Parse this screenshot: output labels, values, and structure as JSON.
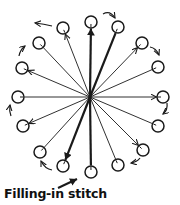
{
  "caption": "Filling-in stitch",
  "diagram": {
    "center": [
      90,
      97
    ],
    "stroke_color": "#1a1a1a",
    "circle_radius": 6,
    "spokes": [
      {
        "id": "top",
        "circle": [
          91,
          22
        ],
        "arrow": "to-circle",
        "weight": "bold"
      },
      {
        "id": "top-right-1",
        "circle": [
          118,
          27
        ],
        "arrow": "none",
        "weight": "bold"
      },
      {
        "id": "top-right-2",
        "circle": [
          142,
          43
        ],
        "arrow": "to-circle",
        "weight": "thin"
      },
      {
        "id": "right-upper",
        "circle": [
          158,
          67
        ],
        "arrow": "none",
        "weight": "thin"
      },
      {
        "id": "right",
        "circle": [
          163,
          97
        ],
        "arrow": "to-circle",
        "weight": "thin"
      },
      {
        "id": "right-lower",
        "circle": [
          158,
          126
        ],
        "arrow": "none",
        "weight": "thin"
      },
      {
        "id": "bottom-right-2",
        "circle": [
          143,
          150
        ],
        "arrow": "to-circle",
        "weight": "thin"
      },
      {
        "id": "bottom-right-1",
        "circle": [
          118,
          165
        ],
        "arrow": "none",
        "weight": "thin"
      },
      {
        "id": "bottom",
        "circle": [
          91,
          172
        ],
        "arrow": "none",
        "weight": "bold"
      },
      {
        "id": "bottom-left-1",
        "circle": [
          63,
          166
        ],
        "arrow": "to-circle",
        "weight": "bold"
      },
      {
        "id": "bottom-left-2",
        "circle": [
          40,
          152
        ],
        "arrow": "none",
        "weight": "thin"
      },
      {
        "id": "left-lower",
        "circle": [
          23,
          126
        ],
        "arrow": "to-circle",
        "weight": "thin"
      },
      {
        "id": "left",
        "circle": [
          18,
          97
        ],
        "arrow": "none",
        "weight": "thin"
      },
      {
        "id": "left-upper",
        "circle": [
          22,
          68
        ],
        "arrow": "to-circle",
        "weight": "thin"
      },
      {
        "id": "top-left-2",
        "circle": [
          39,
          43
        ],
        "arrow": "none",
        "weight": "thin"
      },
      {
        "id": "top-left-1",
        "circle": [
          63,
          28
        ],
        "arrow": "to-circle",
        "weight": "thin"
      }
    ],
    "outer_arrows": [
      {
        "from": [
          103,
          14
        ],
        "to": [
          115,
          18
        ],
        "curve": [
          110,
          10
        ]
      },
      {
        "from": [
          150,
          47
        ],
        "to": [
          159,
          55
        ],
        "curve": [
          156,
          48
        ]
      },
      {
        "from": [
          167,
          103
        ],
        "to": [
          163,
          114
        ],
        "curve": [
          168,
          110
        ]
      },
      {
        "from": [
          140,
          158
        ],
        "to": [
          131,
          163
        ],
        "curve": [
          137,
          162
        ]
      },
      {
        "from": [
          52,
          170
        ],
        "to": [
          41,
          161
        ],
        "curve": [
          45,
          169
        ]
      },
      {
        "from": [
          11,
          116
        ],
        "to": [
          10,
          105
        ],
        "curve": [
          9,
          111
        ]
      },
      {
        "from": [
          19,
          56
        ],
        "to": [
          25,
          46
        ],
        "curve": [
          20,
          50
        ]
      },
      {
        "from": [
          52,
          26
        ],
        "to": [
          35,
          23
        ],
        "curve": [
          44,
          24
        ]
      }
    ],
    "start_arrow": {
      "from": [
        58,
        188
      ],
      "to": [
        77,
        179
      ]
    }
  }
}
